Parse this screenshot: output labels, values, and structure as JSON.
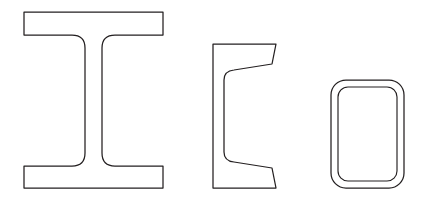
{
  "figure": {
    "background_color": "#ffffff",
    "stroke_color": "#231f20",
    "fill_color": "#ffffff",
    "width": 431,
    "height": 200,
    "shape_count": 3
  },
  "shapes": [
    {
      "id": "i-beam",
      "name": "I-beam (wide flange) cross-section",
      "label": "",
      "order": 1,
      "bounds": {
        "x": 24,
        "y": 12,
        "width": 139,
        "height": 176
      },
      "geometry": {
        "flange_left": 24,
        "flange_right": 163,
        "flange_top_y": 12,
        "flange_top_bottom_y": 35,
        "flange_bottom_top_y": 166,
        "flange_bottom_y": 188,
        "web_left": 85,
        "web_right": 102,
        "fillet_radius": 13
      },
      "path": "M24,12 L163,12 L163,35 L115,35 Q102,35 102,48 L102,153 Q102,166 115,166 L163,166 L163,188 L24,188 L24,166 L72,166 Q85,166 85,153 L85,48 Q85,35 72,35 L24,35 Z"
    },
    {
      "id": "channel",
      "name": "Channel (C-section) cross-section",
      "label": "",
      "order": 2,
      "bounds": {
        "x": 213,
        "y": 44,
        "width": 65,
        "height": 144
      },
      "geometry": {
        "back_left": 213,
        "back_right": 224,
        "top_y": 44,
        "bottom_y": 188,
        "flange_tip_x": 278,
        "flange_taper": true,
        "fillet_radius": 9
      },
      "path": "M213,44 L276,44 L272,64 L234,70 Q224,71 224,80 L224,152 Q224,161 234,162 L272,168 L276,188 L213,188 Z"
    },
    {
      "id": "rectangular-tube",
      "name": "Rectangular hollow structural section (HSS tube)",
      "label": "",
      "order": 3,
      "bounds": {
        "x": 331,
        "y": 80,
        "width": 73,
        "height": 108
      },
      "geometry": {
        "outer_x": 331,
        "outer_y": 80,
        "outer_width": 73,
        "outer_height": 108,
        "outer_corner_radius": 15,
        "wall_thickness": 7,
        "inner_x": 338,
        "inner_y": 87,
        "inner_width": 59,
        "inner_height": 94,
        "inner_corner_radius": 10
      },
      "path": ""
    }
  ]
}
